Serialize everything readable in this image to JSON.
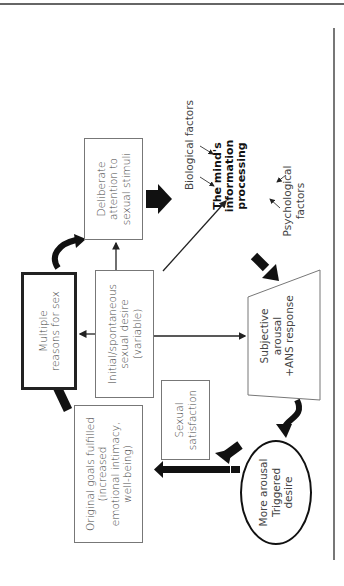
{
  "diagram": {
    "orientation": "rotated -90deg (text reads bottom to top)",
    "nodes": {
      "multiple_reasons": "Multiple reasons for sex",
      "initial_desire_l1": "Initial/spontaneous",
      "initial_desire_l2": "sexual desire",
      "initial_desire_l3": "(variable)",
      "deliberate_l1": "Deliberate",
      "deliberate_l2": "attention to",
      "deliberate_l3": "sexual stimuli",
      "biological": "Biological factors",
      "mind_l1": "The mind's",
      "mind_l2": "information",
      "mind_l3": "processing",
      "psych_l1": "Psychological",
      "psych_l2": "factors",
      "subjective_l1": "Subjective",
      "subjective_l2": "arousal",
      "subjective_l3": "+ANS response",
      "satisfaction_l1": "Sexual",
      "satisfaction_l2": "satisfaction",
      "more_arousal_l1": "More arousal",
      "more_arousal_l2": "Triggered",
      "more_arousal_l3": "desire",
      "goals_l1": "Original goals fulfilled",
      "goals_l2": "(increased",
      "goals_l3": "emotional intimacy,",
      "goals_l4": "well-being)"
    }
  }
}
